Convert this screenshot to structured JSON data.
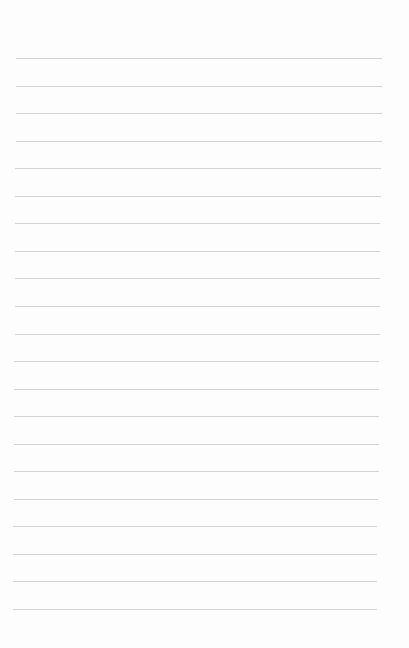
{
  "page": {
    "type": "lined-paper",
    "background_color": "#fdfdfd",
    "rule_color": "#d2d2d2",
    "rule_count": 21,
    "first_rule_y": 58,
    "rule_spacing": 27.55,
    "rule_left_top": 16,
    "rule_left_bottom": 13,
    "rule_right_top": 382,
    "rule_right_bottom": 377,
    "lines": [
      {
        "text": ""
      },
      {
        "text": ""
      },
      {
        "text": ""
      },
      {
        "text": ""
      },
      {
        "text": ""
      },
      {
        "text": ""
      },
      {
        "text": ""
      },
      {
        "text": ""
      },
      {
        "text": ""
      },
      {
        "text": ""
      },
      {
        "text": ""
      },
      {
        "text": ""
      },
      {
        "text": ""
      },
      {
        "text": ""
      },
      {
        "text": ""
      },
      {
        "text": ""
      },
      {
        "text": ""
      },
      {
        "text": ""
      },
      {
        "text": ""
      },
      {
        "text": ""
      },
      {
        "text": ""
      }
    ]
  }
}
